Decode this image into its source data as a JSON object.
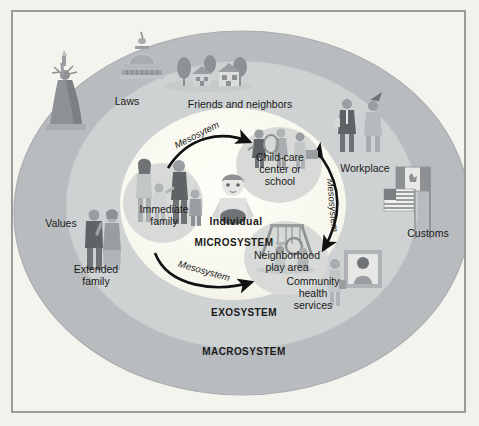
{
  "diagram": {
    "systems": [
      {
        "id": "macrosystem",
        "label": "MACROSYSTEM",
        "ring_color": "#b9bcbe"
      },
      {
        "id": "exosystem",
        "label": "EXOSYSTEM",
        "ring_color": "#cfd2d3"
      },
      {
        "id": "microsystem",
        "label": "MICROSYSTEM",
        "ring_color": "#fbfaf3"
      }
    ],
    "center": {
      "label": "Individual",
      "icon": "child-figure-icon"
    },
    "microsystem_nodes": [
      {
        "id": "immediate-family",
        "label": "Immediate\nfamily",
        "icon": "family-group-icon",
        "blob_color": "#d6d8d6"
      },
      {
        "id": "child-care",
        "label": "Child-care\ncenter or\nschool",
        "icon": "children-classroom-icon",
        "blob_color": "#d6d8d6"
      },
      {
        "id": "neighborhood-play",
        "label": "Neighborhood\nplay area",
        "icon": "playground-swing-icon",
        "blob_color": "#d6d8d6"
      }
    ],
    "exosystem_nodes": [
      {
        "id": "friends-neighbors",
        "label": "Friends and neighbors",
        "icon": "houses-trees-icon"
      },
      {
        "id": "workplace",
        "label": "Workplace",
        "icon": "business-people-icon"
      },
      {
        "id": "community-health",
        "label": "Community\nhealth\nservices",
        "icon": "framed-portrait-icon"
      },
      {
        "id": "extended-family",
        "label": "Extended\nfamily",
        "icon": "elder-couple-icon"
      }
    ],
    "macrosystem_nodes": [
      {
        "id": "laws",
        "label": "Laws",
        "icon": "capitol-dome-icon"
      },
      {
        "id": "values",
        "label": "Values",
        "icon": "statue-of-liberty-icon"
      },
      {
        "id": "customs",
        "label": "Customs",
        "icon": "flags-icon"
      }
    ],
    "mesosystem_arrows": [
      {
        "id": "meso-top",
        "label": "Mesosytem",
        "direction": "family-to-childcare",
        "heads": 1
      },
      {
        "id": "meso-bottom",
        "label": "Mesosystem",
        "direction": "family-to-playarea",
        "heads": 1
      },
      {
        "id": "meso-right",
        "label": "Mesosystem",
        "direction": "childcare-to-playarea",
        "heads": 2
      }
    ],
    "colors": {
      "background": "#f4f3ee",
      "border": "#9a9a9a",
      "macro_ring": "#b9bcbe",
      "exo_ring": "#cfd2d3",
      "micro_ring": "#fbfaf3",
      "blob": "#d6d8d6",
      "text": "#1a1a1a",
      "arrow": "#111111",
      "figure_dark": "#6f7376",
      "figure_mid": "#9a9ea0",
      "figure_light": "#c6c9ca"
    }
  }
}
